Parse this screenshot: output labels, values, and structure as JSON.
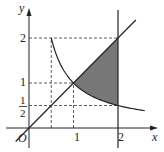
{
  "figure": {
    "axis_labels": {
      "x": "x",
      "y": "y",
      "origin": "O"
    },
    "x_ticks": [
      {
        "value": 1,
        "label": "1"
      },
      {
        "value": 2,
        "label": "2"
      }
    ],
    "y_ticks": [
      {
        "value": 2,
        "label": "2"
      },
      {
        "value": 1,
        "label": "1"
      },
      {
        "value": 0.5,
        "label_num": "1",
        "label_den": "2"
      }
    ],
    "curves": [
      {
        "name": "hyperbola",
        "equation": "y = 1/x",
        "x_from": 0.5,
        "x_to": 2.6
      },
      {
        "name": "line",
        "equation": "y = x",
        "x_from": -0.3,
        "x_to": 2.4
      },
      {
        "name": "vertical-line",
        "equation": "x = 2"
      }
    ],
    "guides": [
      {
        "type": "dashed",
        "x": 0.5,
        "y_range": [
          0,
          2
        ]
      },
      {
        "type": "dashed",
        "x": 1,
        "y_range": [
          0,
          1
        ]
      },
      {
        "type": "dashed",
        "y": 2,
        "x_range": [
          0,
          2
        ]
      },
      {
        "type": "dashed",
        "y": 1,
        "x_range": [
          0,
          1
        ]
      },
      {
        "type": "dashed",
        "y": 0.5,
        "x_range": [
          0,
          2
        ]
      }
    ],
    "shaded_region": {
      "between": [
        "y = x",
        "y = 1/x"
      ],
      "x_range": [
        1,
        2
      ],
      "color": "#777777"
    }
  }
}
